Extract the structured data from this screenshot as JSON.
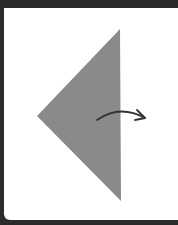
{
  "diagram": {
    "type": "fold-instruction",
    "colors": {
      "frame": "#2b2b2b",
      "panel": "#ffffff",
      "paper": "#8a8a8a",
      "arrow": "#333333"
    },
    "shape": {
      "name": "triangle",
      "points": "120,29 37,116 121,201"
    },
    "arrow": {
      "name": "fold-right-arrow",
      "path": "M97,120 Q120,104 145,118",
      "head": "M137,110 L145,118 L135,120"
    }
  }
}
